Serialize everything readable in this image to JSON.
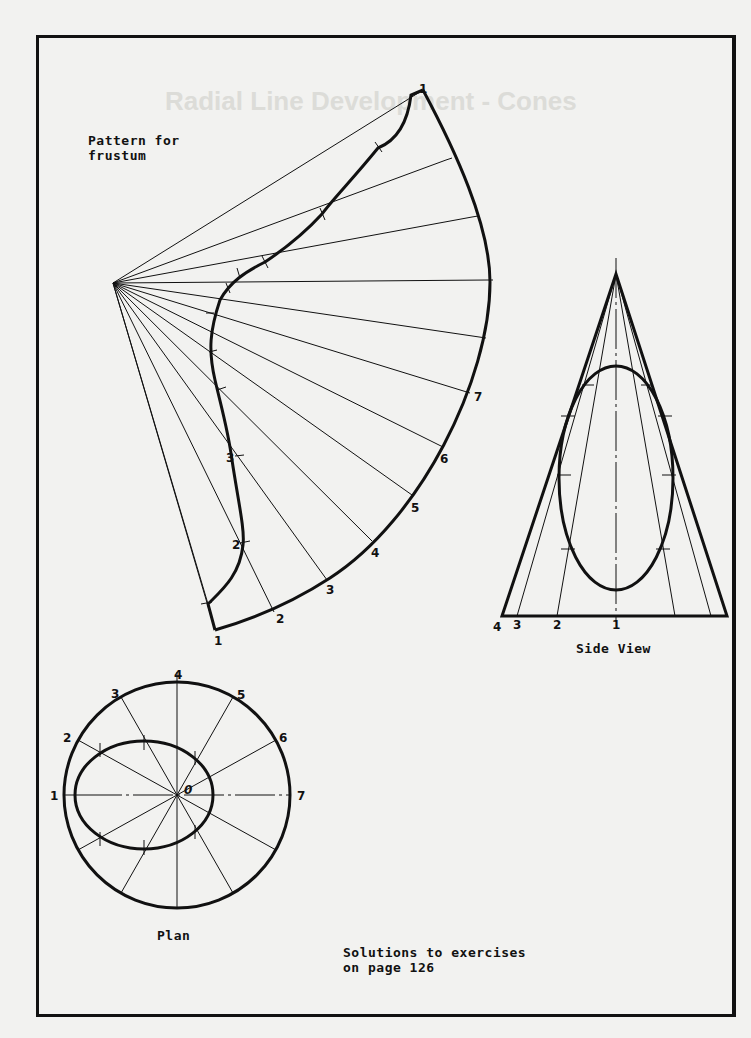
{
  "page": {
    "faint_header": "Radial Line Development - Cones",
    "colors": {
      "paper": "#f2f2f0",
      "ink": "#111111",
      "ghost": "#dcdcd8"
    }
  },
  "pattern": {
    "title": "Pattern for\nfrustum",
    "outer_arc_labels": [
      "1",
      "2",
      "3",
      "4",
      "5",
      "6",
      "7"
    ],
    "inner_curve_labels": [
      "3",
      "2"
    ],
    "top_label": "1",
    "bottom_label": "1"
  },
  "side_view": {
    "caption": "Side View",
    "base_labels": [
      "4",
      "3",
      "2",
      "1"
    ]
  },
  "plan": {
    "caption": "Plan",
    "circle_labels": [
      "1",
      "2",
      "3",
      "4",
      "5",
      "6",
      "7"
    ],
    "center_label": "0"
  },
  "footer": {
    "note": "Solutions to exercises\non page 126"
  }
}
